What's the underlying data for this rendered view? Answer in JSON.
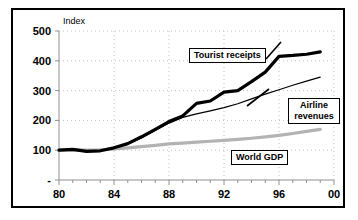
{
  "chart_data": {
    "type": "line",
    "title": "",
    "subtitle": "",
    "xlabel": "",
    "ylabel": "Index",
    "ylim": [
      0,
      500
    ],
    "xlim": [
      1980,
      2000
    ],
    "grid": true,
    "grid_style": "dotted",
    "legend_position": "inline-callouts",
    "y_ticks": [
      "-",
      "100",
      "200",
      "300",
      "400",
      "500"
    ],
    "y_tick_values": [
      0,
      100,
      200,
      300,
      400,
      500
    ],
    "x_ticks": [
      "80",
      "84",
      "88",
      "92",
      "96",
      "00"
    ],
    "x_tick_values": [
      1980,
      1984,
      1988,
      1992,
      1996,
      2000
    ],
    "x_minor_tick_interval": 1,
    "x": [
      1980,
      1981,
      1982,
      1983,
      1984,
      1985,
      1986,
      1987,
      1988,
      1989,
      1990,
      1991,
      1992,
      1993,
      1994,
      1995,
      1996,
      1997,
      1998,
      1999
    ],
    "series": [
      {
        "name": "Tourist receipts",
        "color": "#000000",
        "width": 3.2,
        "values": [
          100,
          103,
          96,
          98,
          108,
          122,
          145,
          170,
          196,
          215,
          257,
          265,
          295,
          300,
          330,
          362,
          415,
          418,
          422,
          430
        ]
      },
      {
        "name": "Airline revenues",
        "color": "#000000",
        "width": 1.2,
        "values": [
          100,
          102,
          97,
          99,
          110,
          121,
          141,
          166,
          191,
          210,
          222,
          232,
          243,
          256,
          272,
          288,
          303,
          318,
          332,
          345
        ]
      },
      {
        "name": "World GDP",
        "color": "#b3b3b3",
        "width": 3.2,
        "values": [
          100,
          101,
          100,
          101,
          104,
          108,
          112,
          116,
          121,
          124,
          127,
          130,
          133,
          136,
          140,
          145,
          150,
          156,
          163,
          170
        ]
      }
    ],
    "annotations": [
      {
        "label": "Tourist receipts",
        "series": "Tourist receipts"
      },
      {
        "label": "Airline\nrevenues",
        "series": "Airline revenues"
      },
      {
        "label": "World GDP",
        "series": "World GDP"
      }
    ]
  },
  "labels": {
    "y_axis_title": "Index",
    "callout_tourist": "Tourist receipts",
    "callout_airline_line1": "Airline",
    "callout_airline_line2": "revenues",
    "callout_gdp": "World GDP"
  },
  "axis": {
    "y_tick_500": "500",
    "y_tick_400": "400",
    "y_tick_300": "300",
    "y_tick_200": "200",
    "y_tick_100": "100",
    "y_tick_0": "-",
    "x_tick_80": "80",
    "x_tick_84": "84",
    "x_tick_88": "88",
    "x_tick_92": "92",
    "x_tick_96": "96",
    "x_tick_00": "00"
  },
  "colors": {
    "tourist": "#000000",
    "airline": "#000000",
    "world_gdp": "#b3b3b3",
    "grid": "#bfbfbf",
    "axis": "#808080",
    "frame": "#000000",
    "background": "#ffffff"
  }
}
